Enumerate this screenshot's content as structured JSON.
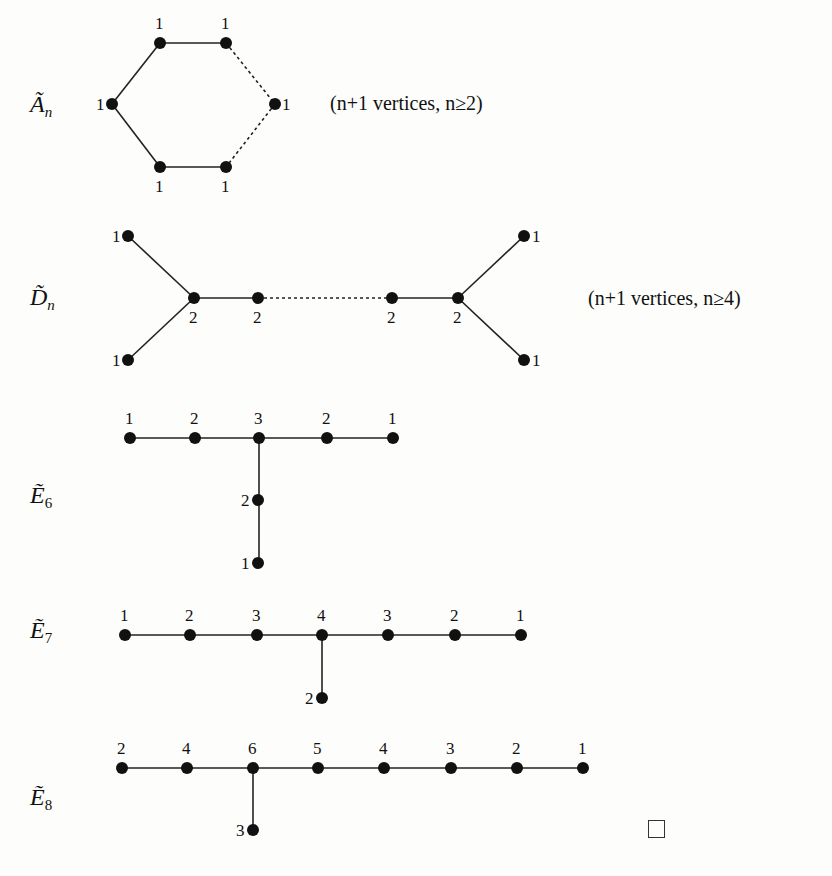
{
  "diagrams": {
    "A": {
      "name": "Ã",
      "subscript": "n",
      "note": "(n+1 vertices, n≥2)",
      "vertices": [
        {
          "x": 160,
          "y": 43,
          "label": "1"
        },
        {
          "x": 226,
          "y": 43,
          "label": "1"
        },
        {
          "x": 112,
          "y": 104,
          "label": "1"
        },
        {
          "x": 275,
          "y": 104,
          "label": "1"
        },
        {
          "x": 160,
          "y": 167,
          "label": "1"
        },
        {
          "x": 226,
          "y": 167,
          "label": "1"
        }
      ]
    },
    "D": {
      "name": "D̃",
      "subscript": "n",
      "note": "(n+1 vertices, n≥4)",
      "vertices": [
        {
          "x": 128,
          "y": 236,
          "label": "1"
        },
        {
          "x": 128,
          "y": 360,
          "label": "1"
        },
        {
          "x": 194,
          "y": 298,
          "label": "2"
        },
        {
          "x": 258,
          "y": 298,
          "label": "2"
        },
        {
          "x": 392,
          "y": 298,
          "label": "2"
        },
        {
          "x": 458,
          "y": 298,
          "label": "2"
        },
        {
          "x": 524,
          "y": 236,
          "label": "1"
        },
        {
          "x": 524,
          "y": 360,
          "label": "1"
        }
      ]
    },
    "E6": {
      "name": "Ẽ",
      "subscript": "6",
      "labels": [
        "1",
        "2",
        "3",
        "2",
        "1",
        "2",
        "1"
      ]
    },
    "E7": {
      "name": "Ẽ",
      "subscript": "7",
      "labels": [
        "1",
        "2",
        "3",
        "4",
        "3",
        "2",
        "1",
        "2"
      ]
    },
    "E8": {
      "name": "Ẽ",
      "subscript": "8",
      "labels": [
        "2",
        "4",
        "6",
        "5",
        "4",
        "3",
        "2",
        "1",
        "3"
      ]
    }
  },
  "end_mark": "□"
}
